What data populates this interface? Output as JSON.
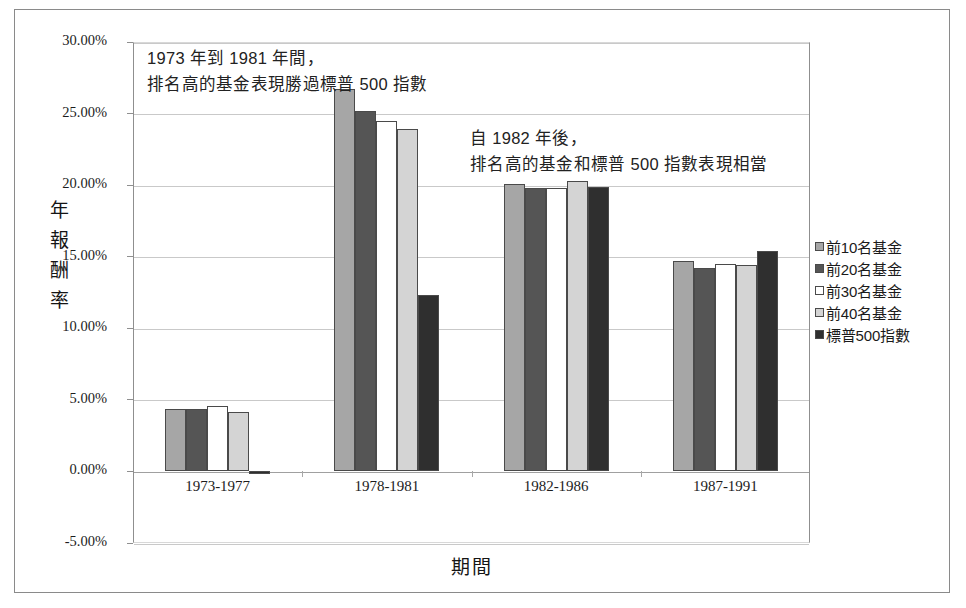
{
  "chart_data": {
    "type": "bar",
    "title": "",
    "xlabel": "期間",
    "ylabel": "年報酬率",
    "categories": [
      "1973-1977",
      "1978-1981",
      "1982-1986",
      "1987-1991"
    ],
    "series": [
      {
        "name": "前10名基金",
        "color": "#a6a6a6",
        "values": [
          4.35,
          26.7,
          20.1,
          14.7
        ]
      },
      {
        "name": "前20名基金",
        "color": "#555555",
        "values": [
          4.35,
          25.2,
          19.8,
          14.2
        ]
      },
      {
        "name": "前30名基金",
        "color": "#ffffff",
        "values": [
          4.6,
          24.5,
          19.8,
          14.5
        ]
      },
      {
        "name": "前40名基金",
        "color": "#d4d4d4",
        "values": [
          4.15,
          23.9,
          20.3,
          14.4
        ]
      },
      {
        "name": "標普500指數",
        "color": "#2f2f2f",
        "values": [
          -0.2,
          12.35,
          19.9,
          15.4
        ]
      }
    ],
    "ylim": [
      -5.0,
      30.0
    ],
    "ytick_values": [
      30,
      25,
      20,
      15,
      10,
      5,
      0,
      -5
    ],
    "ytick_labels": [
      "30.00%",
      "25.00%",
      "20.00%",
      "15.00%",
      "10.00%",
      "5.00%",
      "0.00%",
      "-5.00%"
    ],
    "grid": true,
    "legend_position": "right",
    "annotations": [
      {
        "line1": "1973 年到 1981 年間，",
        "line2": "排名高的基金表現勝過標普 500 指數"
      },
      {
        "line1": "自 1982 年後，",
        "line2": "排名高的基金和標普 500 指數表現相當"
      }
    ]
  },
  "axis": {
    "y_title_chars": [
      "年",
      "報",
      "酬",
      "率"
    ]
  }
}
